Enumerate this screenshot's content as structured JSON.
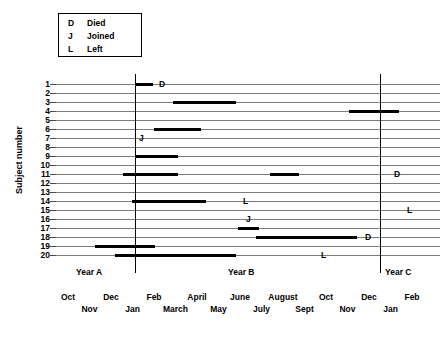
{
  "legend": {
    "entries": [
      {
        "key": "D",
        "label": "Died"
      },
      {
        "key": "J",
        "label": "Joined"
      },
      {
        "key": "L",
        "label": "Left"
      }
    ]
  },
  "axis": {
    "ylabel": "Subject number",
    "year_bands": [
      {
        "label": "Year A",
        "x": 88
      },
      {
        "label": "Year B",
        "x": 238
      },
      {
        "label": "Year C",
        "x": 388
      }
    ],
    "months_top": [
      "Oct",
      "Dec",
      "Feb",
      "April",
      "June",
      "August",
      "Oct",
      "Dec",
      "Feb"
    ],
    "months_bottom": [
      "Nov",
      "Jan",
      "March",
      "May",
      "July",
      "Sept",
      "Nov",
      "Jan"
    ]
  },
  "chart_data": {
    "type": "bar",
    "title": "",
    "xlabel": "",
    "ylabel": "Subject number",
    "categories": [
      1,
      2,
      3,
      4,
      5,
      6,
      7,
      8,
      9,
      10,
      11,
      12,
      13,
      14,
      15,
      16,
      17,
      18,
      19,
      20
    ],
    "xlim": [
      0,
      384
    ],
    "x_axis_kind": "time",
    "x_tick_labels_top": [
      "Oct",
      "Dec",
      "Feb",
      "April",
      "June",
      "August",
      "Oct",
      "Dec",
      "Feb"
    ],
    "x_tick_labels_bottom": [
      "Nov",
      "Jan",
      "March",
      "May",
      "July",
      "Sept",
      "Nov",
      "Jan"
    ],
    "year_dividers_px": [
      79,
      324
    ],
    "grid": true,
    "legend_position": "top-left",
    "series": [
      {
        "name": "Subject 1",
        "subject": 1,
        "bars": [
          {
            "start": 79,
            "end": 97
          }
        ],
        "events": [
          {
            "key": "D",
            "x": 103
          }
        ]
      },
      {
        "name": "Subject 2",
        "subject": 2,
        "bars": [],
        "events": []
      },
      {
        "name": "Subject 3",
        "subject": 3,
        "bars": [
          {
            "start": 117,
            "end": 180
          }
        ],
        "events": []
      },
      {
        "name": "Subject 4",
        "subject": 4,
        "bars": [
          {
            "start": 293,
            "end": 343
          }
        ],
        "events": []
      },
      {
        "name": "Subject 5",
        "subject": 5,
        "bars": [],
        "events": []
      },
      {
        "name": "Subject 6",
        "subject": 6,
        "bars": [
          {
            "start": 98,
            "end": 145
          }
        ],
        "events": []
      },
      {
        "name": "Subject 7",
        "subject": 7,
        "bars": [],
        "events": [
          {
            "key": "J",
            "x": 83
          }
        ]
      },
      {
        "name": "Subject 8",
        "subject": 8,
        "bars": [],
        "events": []
      },
      {
        "name": "Subject 9",
        "subject": 9,
        "bars": [
          {
            "start": 79,
            "end": 122
          }
        ],
        "events": []
      },
      {
        "name": "Subject 10",
        "subject": 10,
        "bars": [],
        "events": []
      },
      {
        "name": "Subject 11",
        "subject": 11,
        "bars": [
          {
            "start": 67,
            "end": 122
          },
          {
            "start": 214,
            "end": 243
          }
        ],
        "events": [
          {
            "key": "D",
            "x": 338
          }
        ]
      },
      {
        "name": "Subject 12",
        "subject": 12,
        "bars": [],
        "events": []
      },
      {
        "name": "Subject 13",
        "subject": 13,
        "bars": [],
        "events": []
      },
      {
        "name": "Subject 14",
        "subject": 14,
        "bars": [
          {
            "start": 76,
            "end": 150
          }
        ],
        "events": [
          {
            "key": "L",
            "x": 187
          }
        ]
      },
      {
        "name": "Subject 15",
        "subject": 15,
        "bars": [],
        "events": [
          {
            "key": "L",
            "x": 351
          }
        ]
      },
      {
        "name": "Subject 16",
        "subject": 16,
        "bars": [],
        "events": [
          {
            "key": "J",
            "x": 190
          }
        ]
      },
      {
        "name": "Subject 17",
        "subject": 17,
        "bars": [
          {
            "start": 182,
            "end": 203
          }
        ],
        "events": []
      },
      {
        "name": "Subject 18",
        "subject": 18,
        "bars": [
          {
            "start": 200,
            "end": 301
          }
        ],
        "events": [
          {
            "key": "D",
            "x": 309
          }
        ]
      },
      {
        "name": "Subject 19",
        "subject": 19,
        "bars": [
          {
            "start": 39,
            "end": 99
          }
        ],
        "events": []
      },
      {
        "name": "Subject 20",
        "subject": 20,
        "bars": [
          {
            "start": 59,
            "end": 180
          }
        ],
        "events": [
          {
            "key": "L",
            "x": 265
          }
        ]
      }
    ]
  },
  "caption": ""
}
